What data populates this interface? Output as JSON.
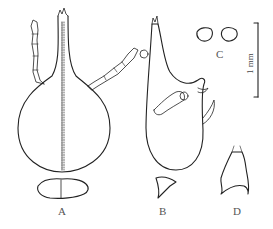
{
  "figure": {
    "panels": [
      {
        "id": "A",
        "label": "A",
        "description": "dorsal view of head with rostrum and antennae; pronotum below"
      },
      {
        "id": "B",
        "label": "B",
        "description": "lateral view of head; small structure below"
      },
      {
        "id": "C",
        "label": "C",
        "description": "two small outline structures"
      },
      {
        "id": "D",
        "label": "D",
        "description": "small structure with setae"
      }
    ],
    "scale_bar": {
      "label": "1 mm"
    },
    "colors": {
      "line": "#222222",
      "label": "#555555",
      "background": "#ffffff"
    }
  }
}
